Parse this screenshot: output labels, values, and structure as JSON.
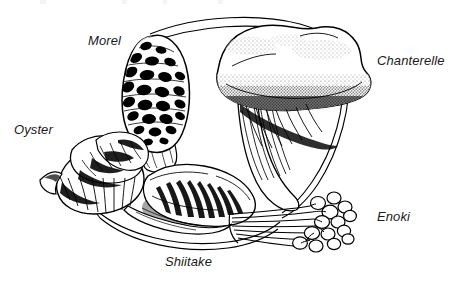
{
  "figure": {
    "kind": "line-illustration",
    "width": 458,
    "height": 283,
    "background_color": "#ffffff",
    "ink_color": "#000000",
    "style": "black and white pen-and-ink engraving with stippling and cross-hatching"
  },
  "labels": [
    {
      "id": "morel",
      "text": "Morel",
      "position": "top-left"
    },
    {
      "id": "chanterelle",
      "text": "Chanterelle",
      "position": "right"
    },
    {
      "id": "oyster",
      "text": "Oyster",
      "position": "left"
    },
    {
      "id": "enoki",
      "text": "Enoki",
      "position": "lower-right"
    },
    {
      "id": "shiitake",
      "text": "Shiitake",
      "position": "bottom-center"
    }
  ],
  "specimens": [
    {
      "id": "morel",
      "name": "Morel",
      "description": "tall conical cap with deep honeycomb pits and ridges, short pale stem"
    },
    {
      "id": "chanterelle",
      "name": "Chanterelle",
      "description": "broad wavy funnel-shaped cap, stippled surface, thick tapering stem with decurrent ridges"
    },
    {
      "id": "oyster",
      "name": "Oyster",
      "description": "cluster of overlapping fan-shaped caps with radial hatching"
    },
    {
      "id": "shiitake",
      "name": "Shiitake",
      "description": "broad rounded cap, dark radial gill shading along the margin"
    },
    {
      "id": "enoki",
      "name": "Enoki",
      "description": "bundle of long slender parallel stems topped with small rounded caps"
    }
  ],
  "frame": {
    "shape": "double-line oval ring encircling the arrangement",
    "line_count": 2
  }
}
